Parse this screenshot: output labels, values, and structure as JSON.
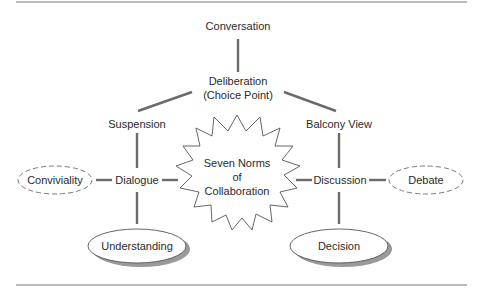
{
  "diagram": {
    "nodes": {
      "conversation": "Conversation",
      "deliberation_line1": "Deliberation",
      "deliberation_line2": "(Choice Point)",
      "suspension": "Suspension",
      "balcony_view": "Balcony View",
      "dialogue": "Dialogue",
      "discussion": "Discussion",
      "conviviality": "Conviviality",
      "debate": "Debate",
      "center_line1": "Seven Norms",
      "center_line2": "of",
      "center_line3": "Collaboration",
      "understanding": "Understanding",
      "decision": "Decision"
    },
    "colors": {
      "line": "#6b6b6b",
      "text": "#2a2a2a",
      "rule": "#777777",
      "shadow": "#9a9a9a"
    }
  }
}
